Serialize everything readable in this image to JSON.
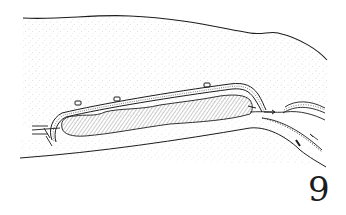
{
  "figure": {
    "number": "9",
    "colors": {
      "ink": "#1c1c1c",
      "stipple": "#9a9a9a",
      "background": "#ffffff"
    }
  }
}
